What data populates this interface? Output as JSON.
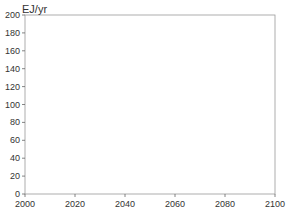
{
  "chart_data": {
    "type": "line",
    "title": "",
    "ylabel": "EJ/yr",
    "xlabel": "",
    "xlim": [
      2000,
      2100
    ],
    "ylim": [
      0,
      200
    ],
    "xticks": [
      2000,
      2020,
      2040,
      2060,
      2080,
      2100
    ],
    "yticks": [
      0,
      20,
      40,
      60,
      80,
      100,
      120,
      140,
      160,
      180,
      200
    ],
    "legend_position": "upper-left",
    "x": [
      2000,
      2010,
      2020,
      2030,
      2040,
      2050,
      2060,
      2070,
      2080,
      2090,
      2100
    ],
    "series": [
      {
        "name": "IMAGE 2.3",
        "color": "#aaaaaa",
        "marker": "none",
        "values": [
          0,
          1,
          3,
          10,
          30,
          80,
          120,
          150,
          172,
          178,
          160
        ]
      },
      {
        "name": "MESSAGE-EMF21",
        "color": "#999999",
        "marker": "square",
        "values": [
          0,
          1,
          5,
          12,
          25,
          40,
          55,
          80,
          68,
          40,
          30
        ]
      },
      {
        "name": "IMAGE 2.3",
        "color": "#555555",
        "marker": "none",
        "values": [
          0,
          1,
          2,
          5,
          10,
          40,
          100,
          160,
          185,
          175,
          150
        ]
      },
      {
        "name": "IGSM",
        "color": "#666666",
        "marker": "x",
        "values": [
          0,
          2,
          19,
          45,
          72,
          115,
          130,
          110,
          100,
          80,
          70
        ]
      },
      {
        "name": "MINICAM",
        "color": "#888888",
        "marker": "circle",
        "values": [
          0,
          1,
          5,
          12,
          30,
          50,
          150,
          155,
          155,
          150,
          148
        ]
      },
      {
        "name": "IMAGE 2.3",
        "color": "#333333",
        "marker": "none",
        "values": [
          0,
          1,
          3,
          8,
          15,
          30,
          60,
          100,
          150,
          175,
          155
        ]
      },
      {
        "name": "IMAGE-EMF21",
        "color": "#111111",
        "marker": "filled-square",
        "values": [
          0,
          1,
          3,
          8,
          12,
          15,
          25,
          28,
          40,
          20,
          5
        ]
      },
      {
        "name": "MESSAGE-EMF21",
        "color": "#111111",
        "marker": "filled-square",
        "values": [
          0,
          1,
          2,
          5,
          8,
          12,
          10,
          10,
          5,
          4,
          5
        ]
      },
      {
        "name": "MESSAGE-A2r",
        "color": "#444444",
        "marker": "square-open",
        "values": [
          0,
          1,
          5,
          10,
          18,
          35,
          55,
          80,
          95,
          100,
          100
        ]
      },
      {
        "name": "IGSM",
        "color": "#111111",
        "marker": "filled-square",
        "values": [
          0,
          1,
          3,
          10,
          15,
          50,
          80,
          100,
          95,
          80,
          50
        ]
      },
      {
        "name": "MINICAM",
        "color": "#222222",
        "marker": "circle",
        "values": [
          0,
          1,
          2,
          5,
          10,
          12,
          15,
          22,
          40,
          80,
          120
        ]
      },
      {
        "name": "IGSM",
        "color": "#cccccc",
        "marker": "x",
        "values": [
          0,
          1,
          5,
          20,
          30,
          40,
          45,
          52,
          58,
          65,
          65
        ]
      },
      {
        "name": "MINICAM",
        "color": "#cccccc",
        "marker": "circle",
        "values": [
          0,
          1,
          2,
          4,
          6,
          8,
          10,
          12,
          20,
          40,
          50
        ]
      }
    ]
  }
}
